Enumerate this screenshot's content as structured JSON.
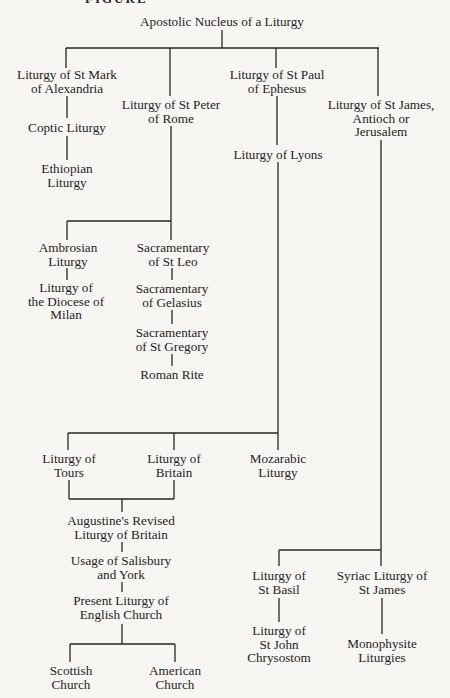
{
  "diagram": {
    "type": "family-tree",
    "root": "Apostolic Nucleus of a Liturgy",
    "cut_heading": "FIGURE",
    "line_color": "#262626",
    "background_color": "#f7f6f2",
    "nodes": {
      "apostolic": {
        "lines": [
          "Apostolic Nucleus of a Liturgy"
        ]
      },
      "mark": {
        "lines": [
          "Liturgy of St Mark",
          "of Alexandria"
        ]
      },
      "coptic": {
        "lines": [
          "Coptic Liturgy"
        ]
      },
      "ethiopian": {
        "lines": [
          "Ethiopian",
          "Liturgy"
        ]
      },
      "peter": {
        "lines": [
          "Liturgy of St Peter",
          "of Rome"
        ]
      },
      "ambrosian": {
        "lines": [
          "Ambrosian",
          "Liturgy"
        ]
      },
      "milan": {
        "lines": [
          "Liturgy of",
          "the Diocese of",
          "Milan"
        ]
      },
      "leo": {
        "lines": [
          "Sacramentary",
          "of St Leo"
        ]
      },
      "gelasius": {
        "lines": [
          "Sacramentary",
          "of Gelasius"
        ]
      },
      "gregory": {
        "lines": [
          "Sacramentary",
          "of St Gregory"
        ]
      },
      "roman": {
        "lines": [
          "Roman Rite"
        ]
      },
      "paul": {
        "lines": [
          "Liturgy of St Paul",
          "of Ephesus"
        ]
      },
      "lyons": {
        "lines": [
          "Liturgy of Lyons"
        ]
      },
      "tours": {
        "lines": [
          "Liturgy of",
          "Tours"
        ]
      },
      "britain": {
        "lines": [
          "Liturgy of",
          "Britain"
        ]
      },
      "mozarabic": {
        "lines": [
          "Mozarabic",
          "Liturgy"
        ]
      },
      "augustine": {
        "lines": [
          "Augustine's Revised",
          "Liturgy of Britain"
        ]
      },
      "salisbury": {
        "lines": [
          "Usage of Salisbury",
          "and York"
        ]
      },
      "english": {
        "lines": [
          "Present Liturgy of",
          "English Church"
        ]
      },
      "scottish": {
        "lines": [
          "Scottish",
          "Church"
        ]
      },
      "american": {
        "lines": [
          "American",
          "Church"
        ]
      },
      "james": {
        "lines": [
          "Liturgy of St James,",
          "Antioch or",
          "Jerusalem"
        ]
      },
      "basil": {
        "lines": [
          "Liturgy of",
          "St Basil"
        ]
      },
      "chrysostom": {
        "lines": [
          "Liturgy of",
          "St John",
          "Chrysostom"
        ]
      },
      "syriac": {
        "lines": [
          "Syriac Liturgy of",
          "St James"
        ]
      },
      "monophysite": {
        "lines": [
          "Monophysite",
          "Liturgies"
        ]
      }
    },
    "edges": [
      [
        "apostolic",
        "mark"
      ],
      [
        "apostolic",
        "peter"
      ],
      [
        "apostolic",
        "paul"
      ],
      [
        "apostolic",
        "james"
      ],
      [
        "mark",
        "coptic"
      ],
      [
        "coptic",
        "ethiopian"
      ],
      [
        "peter",
        "ambrosian"
      ],
      [
        "peter",
        "leo"
      ],
      [
        "ambrosian",
        "milan"
      ],
      [
        "leo",
        "gelasius"
      ],
      [
        "gelasius",
        "gregory"
      ],
      [
        "gregory",
        "roman"
      ],
      [
        "paul",
        "lyons"
      ],
      [
        "lyons",
        "tours"
      ],
      [
        "lyons",
        "britain"
      ],
      [
        "lyons",
        "mozarabic"
      ],
      [
        "tours",
        "augustine"
      ],
      [
        "britain",
        "augustine"
      ],
      [
        "augustine",
        "salisbury"
      ],
      [
        "salisbury",
        "english"
      ],
      [
        "english",
        "scottish"
      ],
      [
        "english",
        "american"
      ],
      [
        "james",
        "basil"
      ],
      [
        "james",
        "syriac"
      ],
      [
        "basil",
        "chrysostom"
      ],
      [
        "syriac",
        "monophysite"
      ]
    ]
  }
}
